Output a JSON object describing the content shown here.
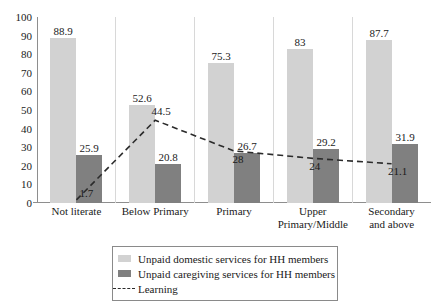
{
  "chart_data": {
    "type": "bar",
    "title": "",
    "subtitle": "",
    "xlabel": "",
    "ylabel": "",
    "ylim": [
      0,
      100
    ],
    "yticks": [
      100,
      90,
      80,
      70,
      60,
      50,
      40,
      30,
      20,
      10,
      0
    ],
    "grid": false,
    "legend_position": "bottom",
    "categories": [
      "Not literate",
      "Below Primary",
      "Primary",
      "Upper\nPrimary/Middle",
      "Secondary\nand above"
    ],
    "series": [
      {
        "name": "Unpaid domestic services for HH members",
        "type": "bar",
        "color": "#d2d2d2",
        "values": [
          88.9,
          52.6,
          75.3,
          83,
          87.7
        ],
        "labels": [
          "88.9",
          "52.6",
          "75.3",
          "83",
          "87.7"
        ]
      },
      {
        "name": "Unpaid caregiving services for HH members",
        "type": "bar",
        "color": "#808080",
        "values": [
          25.9,
          20.8,
          26.7,
          29.2,
          31.9
        ],
        "labels": [
          "25.9",
          "20.8",
          "26.7",
          "29.2",
          "31.9"
        ]
      },
      {
        "name": "Learning",
        "type": "line",
        "style": "dashed",
        "color": "#2b2b2b",
        "values": [
          1.7,
          44.5,
          28,
          24,
          21.1
        ],
        "labels": [
          "1.7",
          "44.5",
          "28",
          "24",
          "21.1"
        ]
      }
    ]
  },
  "legend": {
    "items": [
      {
        "label": "Unpaid domestic services for HH members",
        "swatch": "light-gray-square-icon"
      },
      {
        "label": "Unpaid caregiving services for HH members",
        "swatch": "dark-gray-square-icon"
      },
      {
        "label": "Learning",
        "swatch": "dashed-line-icon"
      }
    ]
  }
}
